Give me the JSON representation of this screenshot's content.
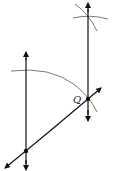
{
  "diagram": {
    "type": "geometric-construction",
    "labels": {
      "point_q": "Q"
    },
    "colors": {
      "line": "#111111",
      "arc": "#555555",
      "background": "#ffffff"
    },
    "elements": {
      "left_vertical_line": {
        "x": 26,
        "y1": 52,
        "y2": 170
      },
      "right_vertical_line": {
        "x": 88,
        "y1": 3,
        "y2": 121
      },
      "diagonal_line": {
        "x1": 5,
        "y1": 168,
        "x2": 101,
        "y2": 88
      },
      "point_bottom": {
        "x": 26,
        "y": 151
      },
      "point_q": {
        "x": 88,
        "y": 99
      }
    }
  }
}
